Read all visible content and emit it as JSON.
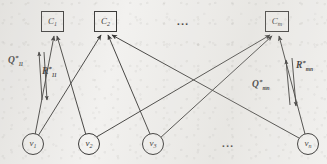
{
  "figure": {
    "type": "bipartite-graph-diagram",
    "width": 327,
    "height": 164,
    "background_color": "#f2f1ef",
    "ink_color": "#1d1c1b"
  },
  "cluster_nodes": {
    "shape": "square",
    "items": [
      {
        "id": "C1",
        "label": "C",
        "sub": "1",
        "x": 52,
        "y": 22
      },
      {
        "id": "C2",
        "label": "C",
        "sub": "2",
        "x": 105,
        "y": 22
      },
      {
        "id": "Cm",
        "label": "C",
        "sub": "m",
        "x": 276,
        "y": 22
      }
    ],
    "ellipsis": {
      "text": "...",
      "x": 185,
      "y": 22
    }
  },
  "vertex_nodes": {
    "shape": "circle",
    "items": [
      {
        "id": "v1",
        "label": "v",
        "sub": "1",
        "x": 32,
        "y": 143
      },
      {
        "id": "v2",
        "label": "v",
        "sub": "2",
        "x": 88,
        "y": 143
      },
      {
        "id": "v3",
        "label": "v",
        "sub": "3",
        "x": 152,
        "y": 143
      },
      {
        "id": "vn",
        "label": "v",
        "sub": "n",
        "x": 307,
        "y": 143
      }
    ],
    "ellipsis": {
      "text": "...",
      "x": 230,
      "y": 143
    }
  },
  "edge_labels": [
    {
      "id": "Q11",
      "base": "Q",
      "sup": "*",
      "sub": "11",
      "x": 8,
      "y": 57
    },
    {
      "id": "R11",
      "base": "R",
      "sup": "*",
      "sub": "11",
      "x": 41,
      "y": 68
    },
    {
      "id": "Qmn",
      "base": "Q",
      "sup": "*",
      "sub": "mn",
      "x": 252,
      "y": 80
    },
    {
      "id": "Rmn",
      "base": "R",
      "sup": "*",
      "sub": "mn",
      "x": 296,
      "y": 61
    }
  ],
  "edges": [
    {
      "from": "v1",
      "to": "C1"
    },
    {
      "from": "v1",
      "to": "C2"
    },
    {
      "from": "v2",
      "to": "C1"
    },
    {
      "from": "v2",
      "to": "Cm"
    },
    {
      "from": "v3",
      "to": "C2"
    },
    {
      "from": "v3",
      "to": "Cm"
    },
    {
      "from": "vn",
      "to": "C2"
    },
    {
      "from": "vn",
      "to": "Cm"
    }
  ],
  "message_pairs": [
    {
      "id": "pair-left",
      "up_label": "Q11",
      "down_label": "R11",
      "between": [
        "v1",
        "C1"
      ]
    },
    {
      "id": "pair-right",
      "up_label": "Qmn",
      "down_label": "Rmn",
      "between": [
        "vn",
        "Cm"
      ]
    }
  ]
}
